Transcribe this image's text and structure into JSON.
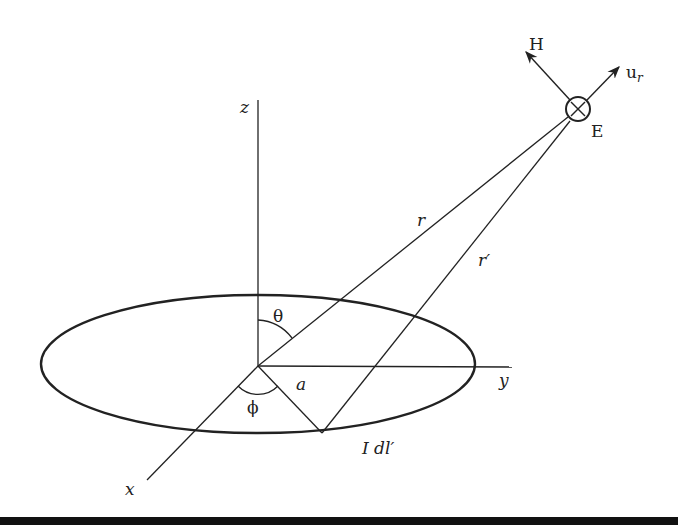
{
  "diagram": {
    "axes": {
      "x": "x",
      "y": "y",
      "z": "z"
    },
    "labels": {
      "theta": "θ",
      "phi": "ϕ",
      "radius": "a",
      "r": "r",
      "r_prime": "r′",
      "current_element": "I dl′",
      "H": "H",
      "E": "E",
      "u_r_base": "u",
      "u_r_sub": "r"
    },
    "field_point_symbol": "circle-cross",
    "colors": {
      "line": "#222222",
      "background": "#ffffff"
    }
  }
}
